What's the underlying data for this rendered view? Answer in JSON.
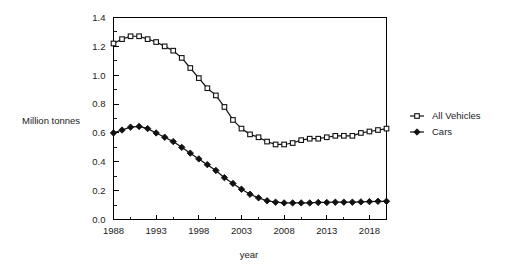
{
  "chart_data": {
    "type": "line",
    "title": "",
    "subtitle": "",
    "xlabel": "year",
    "ylabel": "Million tonnes",
    "xlim": [
      1988,
      2020
    ],
    "ylim": [
      0.0,
      1.4
    ],
    "grid": false,
    "legend_position": "right",
    "x": [
      1988,
      1989,
      1990,
      1991,
      1992,
      1993,
      1994,
      1995,
      1996,
      1997,
      1998,
      1999,
      2000,
      2001,
      2002,
      2003,
      2004,
      2005,
      2006,
      2007,
      2008,
      2009,
      2010,
      2011,
      2012,
      2013,
      2014,
      2015,
      2016,
      2017,
      2018,
      2019,
      2020
    ],
    "xticks": [
      1988,
      1993,
      1998,
      2003,
      2008,
      2013,
      2018
    ],
    "xtick_labels": [
      "1988",
      "1993",
      "1998",
      "2003",
      "2008",
      "2013",
      "2018"
    ],
    "xminor_step": 1,
    "yticks": [
      0.0,
      0.2,
      0.4,
      0.6,
      0.8,
      1.0,
      1.2,
      1.4
    ],
    "ytick_labels": [
      "0.0",
      "0.2",
      "0.4",
      "0.6",
      "0.8",
      "1.0",
      "1.2",
      "1.4"
    ],
    "yminor_step": 0.1,
    "series": [
      {
        "name": "All Vehicles",
        "marker": "open-square",
        "color": "#111111",
        "values": [
          1.22,
          1.25,
          1.27,
          1.27,
          1.25,
          1.23,
          1.2,
          1.17,
          1.12,
          1.05,
          0.98,
          0.91,
          0.86,
          0.78,
          0.69,
          0.63,
          0.59,
          0.57,
          0.54,
          0.52,
          0.52,
          0.53,
          0.55,
          0.56,
          0.56,
          0.57,
          0.58,
          0.58,
          0.58,
          0.6,
          0.61,
          0.62,
          0.63
        ]
      },
      {
        "name": "Cars",
        "marker": "filled-diamond",
        "color": "#111111",
        "values": [
          0.6,
          0.62,
          0.64,
          0.645,
          0.63,
          0.6,
          0.57,
          0.54,
          0.5,
          0.46,
          0.42,
          0.38,
          0.34,
          0.29,
          0.25,
          0.21,
          0.175,
          0.15,
          0.13,
          0.12,
          0.115,
          0.115,
          0.115,
          0.115,
          0.118,
          0.118,
          0.12,
          0.12,
          0.12,
          0.122,
          0.124,
          0.126,
          0.126
        ]
      }
    ],
    "legend": [
      {
        "label": "All Vehicles",
        "marker": "open-square"
      },
      {
        "label": "Cars",
        "marker": "filled-diamond"
      }
    ]
  },
  "axes": {
    "y_axis_title": "Million tonnes",
    "x_axis_title": "year"
  }
}
